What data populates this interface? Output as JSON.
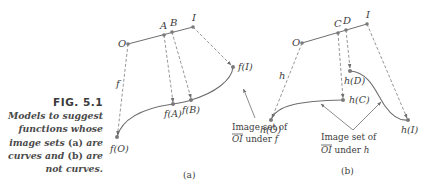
{
  "caption": {
    "figure_number": "FIG. 5.1",
    "lines": [
      "Models to suggest",
      "functions whose",
      "image sets ",
      "(a)",
      " are",
      "curves and ",
      "(b)",
      " are",
      "not curves."
    ]
  },
  "panel_a": {
    "sublabel": "(a)",
    "points": {
      "O": "O",
      "A": "A",
      "B": "B",
      "I": "I"
    },
    "images": {
      "fO": "f(O)",
      "fA": "f(A)",
      "fB": "f(B)",
      "fI": "f(I)"
    },
    "function_label": "f",
    "annotation_line1": "Image set of",
    "annotation_segment": "OI",
    "annotation_under": " under ",
    "annotation_func": "f"
  },
  "panel_b": {
    "sublabel": "(b)",
    "points": {
      "O": "O",
      "C": "C",
      "D": "D",
      "I": "I"
    },
    "images": {
      "hO": "h(O)",
      "hC": "h(C)",
      "hD": "h(D)",
      "hI": "h(I)"
    },
    "function_label": "h",
    "annotation_line1": "Image set of",
    "annotation_segment": "OI",
    "annotation_under": " under ",
    "annotation_func": "h"
  },
  "colors": {
    "line": "#6e6e6e",
    "point": "#7a7a7a",
    "text": "#3c3c3c"
  }
}
